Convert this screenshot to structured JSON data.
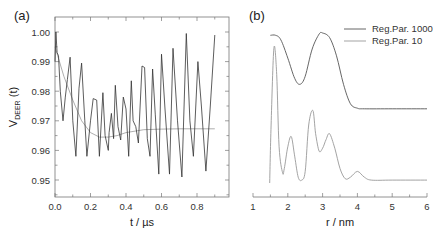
{
  "chart_data": [
    {
      "panel": "(a)",
      "type": "line",
      "xlabel": "t / µs",
      "ylabel": "V_DEER (t)",
      "xlim": [
        0.0,
        0.9
      ],
      "ylim": [
        0.945,
        1.0035
      ],
      "xticks": [
        "0.0",
        "0.2",
        "0.4",
        "0.6",
        "0.8"
      ],
      "yticks": [
        "1.00",
        "0.99",
        "0.98",
        "0.97",
        "0.96",
        "0.95"
      ],
      "grid": false,
      "series": [
        {
          "name": "experimental DEER trace",
          "color": "#333333",
          "x": [
            0.0,
            0.005,
            0.012,
            0.02,
            0.03,
            0.045,
            0.058,
            0.07,
            0.085,
            0.1,
            0.118,
            0.135,
            0.15,
            0.168,
            0.18,
            0.2,
            0.215,
            0.235,
            0.25,
            0.27,
            0.282,
            0.3,
            0.305,
            0.318,
            0.33,
            0.34,
            0.355,
            0.37,
            0.385,
            0.4,
            0.415,
            0.43,
            0.44,
            0.455,
            0.47,
            0.49,
            0.505,
            0.52,
            0.535,
            0.55,
            0.565,
            0.585,
            0.6,
            0.62,
            0.645,
            0.665,
            0.69,
            0.715,
            0.74,
            0.76,
            0.78,
            0.805,
            0.825,
            0.85,
            0.875,
            0.9
          ],
          "y": [
            0.99,
            1.0,
            0.993,
            0.992,
            0.98,
            0.97,
            0.978,
            0.984,
            0.9915,
            0.97,
            0.958,
            0.981,
            0.9895,
            0.97,
            0.958,
            0.97,
            0.9775,
            0.977,
            0.958,
            0.9795,
            0.965,
            0.96,
            0.966,
            0.9725,
            0.964,
            0.982,
            0.968,
            0.9635,
            0.978,
            0.974,
            0.958,
            0.9835,
            0.97,
            0.968,
            0.9625,
            0.9885,
            0.988,
            0.964,
            0.958,
            0.9875,
            0.972,
            0.952,
            0.9925,
            0.974,
            0.952,
            0.9945,
            0.97,
            0.951,
            0.9995,
            0.97,
            0.958,
            0.99,
            0.975,
            0.953,
            0.975,
            0.999
          ]
        },
        {
          "name": "background/fit",
          "color": "#999999",
          "x": [
            0.0,
            0.05,
            0.1,
            0.15,
            0.2,
            0.25,
            0.3,
            0.35,
            0.4,
            0.5,
            0.6,
            0.7,
            0.8,
            0.9
          ],
          "y": [
            0.995,
            0.985,
            0.977,
            0.97,
            0.966,
            0.9645,
            0.9645,
            0.965,
            0.966,
            0.967,
            0.9672,
            0.9673,
            0.9673,
            0.9673
          ]
        }
      ]
    },
    {
      "panel": "(b)",
      "type": "line",
      "xlabel": "r / nm",
      "ylabel": "",
      "xlim": [
        1,
        6
      ],
      "xticks": [
        "1",
        "2",
        "3",
        "4",
        "5",
        "6"
      ],
      "legend_position": "upper right",
      "grid": false,
      "series": [
        {
          "name": "Reg.Par. 1000",
          "color": "#555555",
          "x": [
            1.5,
            1.65,
            1.8,
            2.0,
            2.2,
            2.35,
            2.5,
            2.7,
            2.9,
            3.0,
            3.2,
            3.4,
            3.6,
            3.8,
            4.0,
            4.2,
            5.0,
            6.0
          ],
          "y": [
            0.98,
            0.98,
            0.94,
            0.78,
            0.6,
            0.55,
            0.62,
            0.86,
            0.99,
            1.0,
            0.96,
            0.8,
            0.55,
            0.38,
            0.34,
            0.335,
            0.335,
            0.335
          ]
        },
        {
          "name": "Reg.Par. 10",
          "color": "#999999",
          "x": [
            1.48,
            1.52,
            1.6,
            1.68,
            1.75,
            1.85,
            1.9,
            2.0,
            2.1,
            2.2,
            2.3,
            2.4,
            2.5,
            2.6,
            2.72,
            2.8,
            2.9,
            3.0,
            3.1,
            3.2,
            3.35,
            3.5,
            3.65,
            3.8,
            4.0,
            4.2,
            4.4,
            5.0,
            6.0
          ],
          "y": [
            0.0,
            0.4,
            0.93,
            0.75,
            0.25,
            0.07,
            0.1,
            0.25,
            0.32,
            0.18,
            0.04,
            0.02,
            0.08,
            0.4,
            0.5,
            0.34,
            0.22,
            0.24,
            0.3,
            0.34,
            0.24,
            0.1,
            0.03,
            0.04,
            0.08,
            0.04,
            0.02,
            0.02,
            0.02
          ]
        }
      ]
    }
  ],
  "panels": {
    "a": {
      "label": "(a)",
      "ylabel_main": "V",
      "ylabel_sub": "DEER",
      "ylabel_tail": " (t)",
      "xlabel": "t / µs",
      "xticks": [
        "0.0",
        "0.2",
        "0.4",
        "0.6",
        "0.8"
      ],
      "yticks": [
        "1.00",
        "0.99",
        "0.98",
        "0.97",
        "0.96",
        "0.95"
      ]
    },
    "b": {
      "label": "(b)",
      "xlabel": "r / nm",
      "xticks": [
        "1",
        "2",
        "3",
        "4",
        "5",
        "6"
      ],
      "legend": [
        "Reg.Par. 1000",
        "Reg.Par. 10"
      ]
    }
  }
}
